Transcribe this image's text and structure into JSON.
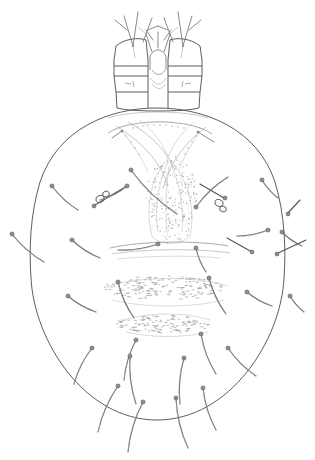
{
  "figure": {
    "title": "Mite ventral habitus line drawing",
    "background_color": "#ffffff",
    "ink_color": "#4a4a52",
    "canvas": {
      "width": 315,
      "height": 460
    },
    "regions": [
      {
        "name": "gnathosoma",
        "label": "Gnathosoma"
      },
      {
        "name": "palp-left",
        "label": "Left palp"
      },
      {
        "name": "palp-right",
        "label": "Right palp"
      },
      {
        "name": "chelicerae",
        "label": "Chelicerae"
      },
      {
        "name": "idiosoma",
        "label": "Idiosoma"
      },
      {
        "name": "dorsal-shield",
        "label": "Dorsal shield"
      },
      {
        "name": "anterior-arcs",
        "label": "Anterior arcs"
      },
      {
        "name": "genital-shield",
        "label": "Genital shield"
      },
      {
        "name": "striated-band-upper",
        "label": "Upper striated band"
      },
      {
        "name": "striated-band-lower",
        "label": "Lower striated band"
      },
      {
        "name": "transverse-line",
        "label": "Transverse line"
      },
      {
        "name": "gland-pore-left",
        "label": "Left gland pore"
      },
      {
        "name": "gland-pore-right",
        "label": "Right gland pore"
      }
    ],
    "counts": {
      "setae_total": 34,
      "palps": 2,
      "gland_pores": 2,
      "striated_bands": 2
    }
  },
  "chart_data": {
    "type": "scatter",
    "title": "Mite ventral habitus line drawing",
    "xlabel": "",
    "ylabel": "",
    "xlim": [
      0,
      315
    ],
    "ylim": [
      0,
      460
    ],
    "grid": false,
    "legend": "none",
    "body_outline": {
      "name": "idiosoma-outline",
      "cx": 157,
      "cy": 278,
      "rx": 128,
      "ry": 160,
      "path": "M 157 108 C 88 108 32 175 31 262 C 30 350 85 420 157 420 C 229 420 284 350 283 262 C 282 175 226 108 157 108 Z"
    },
    "gnathosoma": {
      "name": "gnathosoma-outline",
      "x_range": [
        112,
        206
      ],
      "y_range": [
        12,
        110
      ]
    },
    "setae": [
      {
        "id": "s01",
        "x1": 52,
        "y1": 186,
        "x2": 78,
        "y2": 210,
        "tip": "start"
      },
      {
        "id": "s02",
        "x1": 100,
        "y1": 200,
        "x2": 127,
        "y2": 186,
        "tip": "end"
      },
      {
        "id": "s03",
        "x1": 131,
        "y1": 170,
        "x2": 177,
        "y2": 214,
        "tip": "start"
      },
      {
        "id": "s04",
        "x1": 228,
        "y1": 177,
        "x2": 196,
        "y2": 207,
        "tip": "end"
      },
      {
        "id": "s05",
        "x1": 262,
        "y1": 180,
        "x2": 278,
        "y2": 198,
        "tip": "start"
      },
      {
        "id": "s06",
        "x1": 12,
        "y1": 234,
        "x2": 44,
        "y2": 262,
        "tip": "start"
      },
      {
        "id": "s07",
        "x1": 72,
        "y1": 240,
        "x2": 100,
        "y2": 258,
        "tip": "start"
      },
      {
        "id": "s08",
        "x1": 118,
        "y1": 250,
        "x2": 158,
        "y2": 244,
        "tip": "end"
      },
      {
        "id": "s09",
        "x1": 196,
        "y1": 248,
        "x2": 206,
        "y2": 272,
        "tip": "start"
      },
      {
        "id": "s10",
        "x1": 237,
        "y1": 236,
        "x2": 268,
        "y2": 230,
        "tip": "end"
      },
      {
        "id": "s11",
        "x1": 282,
        "y1": 232,
        "x2": 302,
        "y2": 246,
        "tip": "start"
      },
      {
        "id": "s12",
        "x1": 68,
        "y1": 296,
        "x2": 96,
        "y2": 312,
        "tip": "start"
      },
      {
        "id": "s13",
        "x1": 118,
        "y1": 282,
        "x2": 134,
        "y2": 318,
        "tip": "start"
      },
      {
        "id": "s14",
        "x1": 209,
        "y1": 278,
        "x2": 226,
        "y2": 314,
        "tip": "start"
      },
      {
        "id": "s15",
        "x1": 247,
        "y1": 292,
        "x2": 272,
        "y2": 306,
        "tip": "start"
      },
      {
        "id": "s16",
        "x1": 290,
        "y1": 296,
        "x2": 304,
        "y2": 312,
        "tip": "start"
      },
      {
        "id": "s17",
        "x1": 92,
        "y1": 348,
        "x2": 74,
        "y2": 384,
        "tip": "start"
      },
      {
        "id": "s18",
        "x1": 136,
        "y1": 340,
        "x2": 124,
        "y2": 380,
        "tip": "start"
      },
      {
        "id": "s19",
        "x1": 201,
        "y1": 334,
        "x2": 216,
        "y2": 374,
        "tip": "start"
      },
      {
        "id": "s20",
        "x1": 228,
        "y1": 348,
        "x2": 256,
        "y2": 376,
        "tip": "start"
      },
      {
        "id": "s21",
        "x1": 118,
        "y1": 386,
        "x2": 98,
        "y2": 432,
        "tip": "start"
      },
      {
        "id": "s22",
        "x1": 143,
        "y1": 402,
        "x2": 128,
        "y2": 452,
        "tip": "start"
      },
      {
        "id": "s23",
        "x1": 176,
        "y1": 398,
        "x2": 188,
        "y2": 448,
        "tip": "start"
      },
      {
        "id": "s24",
        "x1": 203,
        "y1": 388,
        "x2": 216,
        "y2": 430,
        "tip": "start"
      },
      {
        "id": "s25",
        "x1": 184,
        "y1": 358,
        "x2": 180,
        "y2": 404,
        "tip": "start"
      },
      {
        "id": "s26",
        "x1": 130,
        "y1": 356,
        "x2": 136,
        "y2": 404,
        "tip": "start"
      }
    ],
    "stipple_bands": [
      {
        "name": "striated-band-upper",
        "cx": 162,
        "cy": 288,
        "rx": 60,
        "ry": 12,
        "count": 170
      },
      {
        "name": "striated-band-lower",
        "cx": 162,
        "cy": 324,
        "rx": 48,
        "ry": 9,
        "count": 120
      },
      {
        "name": "genital-shield",
        "cx": 172,
        "cy": 200,
        "rx": 26,
        "ry": 44,
        "count": 260
      }
    ]
  }
}
